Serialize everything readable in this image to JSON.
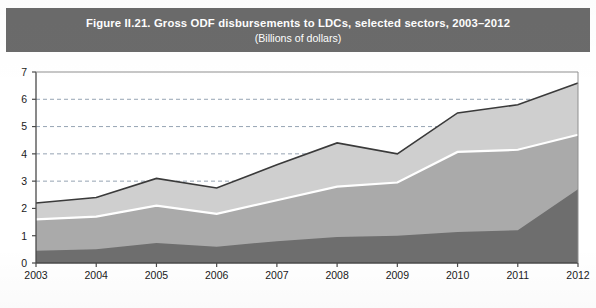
{
  "figure": {
    "title": "Figure II.21. Gross ODF disbursements to LDCs, selected sectors, 2003–2012",
    "subtitle": "(Billions of dollars)",
    "banner_color": "#6b6b6b",
    "banner_text_color": "#ffffff"
  },
  "chart_data": {
    "type": "area",
    "stacked": true,
    "title": "Figure II.21. Gross ODF disbursements to LDCs, selected sectors, 2003–2012",
    "subtitle": "(Billions of dollars)",
    "xlabel": "",
    "ylabel": "",
    "ylim": [
      0,
      7
    ],
    "xlim": [
      2003,
      2012
    ],
    "grid": true,
    "grid_axis": "y",
    "grid_style": "dashed",
    "legend_position": "bottom",
    "legend_visible": false,
    "x": [
      2003,
      2004,
      2005,
      2006,
      2007,
      2008,
      2009,
      2010,
      2011,
      2012
    ],
    "categories": [
      "2003",
      "2004",
      "2005",
      "2006",
      "2007",
      "2008",
      "2009",
      "2010",
      "2011",
      "2012"
    ],
    "y_ticks": [
      0,
      1,
      2,
      3,
      4,
      5,
      6,
      7
    ],
    "y_tick_labels": [
      "0",
      "1",
      "2",
      "3",
      "4",
      "5",
      "6",
      "7"
    ],
    "series": [
      {
        "name": "series-1-bottom",
        "color": "#6e6e6e",
        "values": [
          0.45,
          0.5,
          0.73,
          0.6,
          0.8,
          0.95,
          1.0,
          1.14,
          1.2,
          2.7
        ]
      },
      {
        "name": "series-2-middle",
        "color": "#aaaaaa",
        "values": [
          1.15,
          1.2,
          1.37,
          1.2,
          1.5,
          1.85,
          1.95,
          2.93,
          2.95,
          2.0
        ]
      },
      {
        "name": "series-3-top",
        "color": "#cfcfcf",
        "values": [
          0.6,
          0.7,
          1.0,
          0.95,
          1.3,
          1.6,
          1.05,
          1.43,
          1.65,
          1.9
        ]
      }
    ],
    "cumulative_upper_bounds": {
      "series-1-bottom": [
        0.45,
        0.5,
        0.73,
        0.6,
        0.8,
        0.95,
        1.0,
        1.14,
        1.2,
        2.7
      ],
      "series-2-middle": [
        1.6,
        1.7,
        2.1,
        1.8,
        2.3,
        2.8,
        2.95,
        4.07,
        4.15,
        4.7
      ],
      "series-3-top": [
        2.2,
        2.4,
        3.1,
        2.75,
        3.6,
        4.4,
        4.0,
        5.5,
        5.8,
        6.6
      ]
    },
    "totals": [
      2.2,
      2.4,
      3.1,
      2.75,
      3.6,
      4.4,
      4.0,
      5.5,
      5.8,
      6.6
    ],
    "separator_line_color": "#ffffff",
    "outline_color": "#3a3a3a",
    "axis_color": "#4a4a4a",
    "gridline_color": "#8a9aaa",
    "plot_background": "#ffffff"
  }
}
